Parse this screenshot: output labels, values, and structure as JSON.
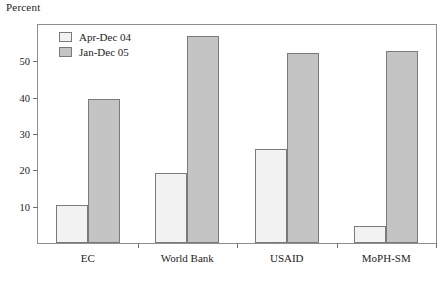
{
  "chart_data": {
    "type": "bar",
    "title": "",
    "xlabel": "",
    "ylabel": "Percent",
    "ylim": [
      0,
      60
    ],
    "yticks": [
      10,
      20,
      30,
      40,
      50
    ],
    "ytick_labels": [
      "10",
      "20",
      "30",
      "40",
      "50"
    ],
    "grid": false,
    "legend_position": "top-left-inside",
    "categories": [
      "EC",
      "World Bank",
      "USAID",
      "MoPH-SM"
    ],
    "series": [
      {
        "name": "Apr-Dec 04",
        "color": "#f2f2f2",
        "values": [
          10.5,
          19.2,
          25.9,
          4.6
        ]
      },
      {
        "name": "Jan-Dec 05",
        "color": "#c4c4c4",
        "values": [
          39.7,
          57.0,
          52.3,
          52.8
        ]
      }
    ]
  },
  "legend": {
    "items": [
      {
        "label": "Apr-Dec 04",
        "swatch": "light-swatch"
      },
      {
        "label": "Jan-Dec 05",
        "swatch": "gray-swatch"
      }
    ]
  }
}
